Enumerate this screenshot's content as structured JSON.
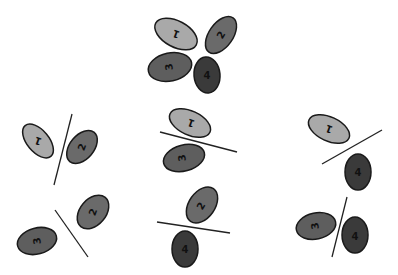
{
  "diagram": {
    "colors": {
      "cell1": "#a9a9a9",
      "cell2": "#6a6a6a",
      "cell3": "#5e5e5e",
      "cell4": "#3a3a3a",
      "stroke": "#1a1a1a",
      "line": "#222222"
    },
    "top_group": {
      "labels": [
        "1",
        "2",
        "3",
        "4"
      ]
    },
    "panels": [
      {
        "id": "1-2",
        "labels": [
          "1",
          "2"
        ]
      },
      {
        "id": "1-3",
        "labels": [
          "1",
          "3"
        ]
      },
      {
        "id": "1-4",
        "labels": [
          "1",
          "4"
        ]
      },
      {
        "id": "2-3",
        "labels": [
          "3",
          "2"
        ]
      },
      {
        "id": "2-4",
        "labels": [
          "2",
          "4"
        ]
      },
      {
        "id": "3-4",
        "labels": [
          "3",
          "4"
        ]
      }
    ]
  }
}
